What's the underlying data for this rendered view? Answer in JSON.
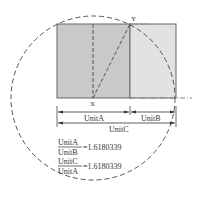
{
  "diagram": {
    "points": {
      "x_label": "X",
      "y_label": "Y"
    },
    "dimensions": {
      "unit_a": "UnitA",
      "unit_b": "UnitB",
      "unit_c": "UnitC"
    },
    "formulas": [
      {
        "numerator": "UnitA",
        "denominator": "UnitB",
        "value": "=1.6180339"
      },
      {
        "numerator": "UnitC",
        "denominator": "UnitA",
        "value": "=1.6180339"
      }
    ],
    "colors": {
      "square_fill": "#c9c9c9",
      "rect_fill": "#e2e2e2",
      "stroke": "#666666",
      "dash": "#555555",
      "text": "#333333"
    }
  }
}
